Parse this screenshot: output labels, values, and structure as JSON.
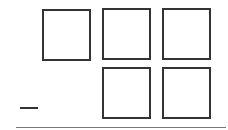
{
  "problem": {
    "operator": "minus",
    "top_row": [
      {
        "value": ""
      },
      {
        "value": ""
      },
      {
        "value": ""
      }
    ],
    "bottom_row": [
      {
        "value": ""
      },
      {
        "value": ""
      }
    ]
  },
  "colors": {
    "stroke": "#333333",
    "rule": "#777777",
    "background": "#ffffff"
  }
}
